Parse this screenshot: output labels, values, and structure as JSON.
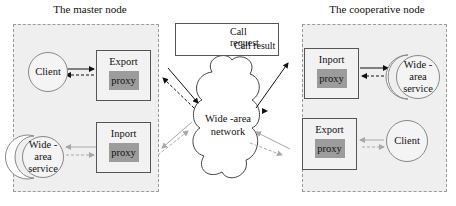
{
  "diagram": {
    "master_node": {
      "title": "The master node",
      "client": {
        "label": "Client"
      },
      "export_proxy": {
        "title": "Export",
        "inner": "proxy"
      },
      "wide_area_service": {
        "line1": "Wide -",
        "line2": "area",
        "line3": "service"
      },
      "inport_proxy": {
        "title": "Inport",
        "inner": "proxy"
      }
    },
    "cooperative_node": {
      "title": "The cooperative node",
      "inport_proxy": {
        "title": "Inport",
        "inner": "proxy"
      },
      "wide_area_service": {
        "line1": "Wide -",
        "line2": "area",
        "line3": "service"
      },
      "export_proxy": {
        "title": "Export",
        "inner": "proxy"
      },
      "client": {
        "label": "Client"
      }
    },
    "network": {
      "line1": "Wide -area",
      "line2": "network"
    },
    "legend": {
      "items": [
        {
          "style": "solid-arrow-right",
          "label": "Call request"
        },
        {
          "style": "dashed-arrow-left",
          "label": "Call result"
        }
      ]
    },
    "colors": {
      "node_background": "#efefef",
      "node_border": "#9a9a9a",
      "proxy_inner": "#9c9c9c",
      "active_arrow": "#111111",
      "inactive_arrow": "#a8a8a8"
    }
  }
}
